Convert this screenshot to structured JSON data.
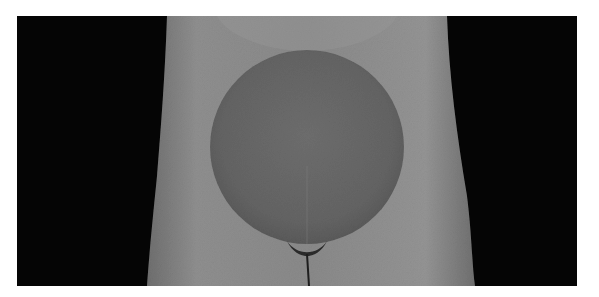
{
  "image": {
    "description": "Grayscale photograph of a pregnant torso front view with a large round belly against a black background",
    "colors": {
      "background_frame": "#ffffff",
      "backdrop": "#050505",
      "skin_light": "#9a9a9a",
      "skin_mid": "#7f7f7f",
      "belly": "#6a6a6a"
    }
  }
}
